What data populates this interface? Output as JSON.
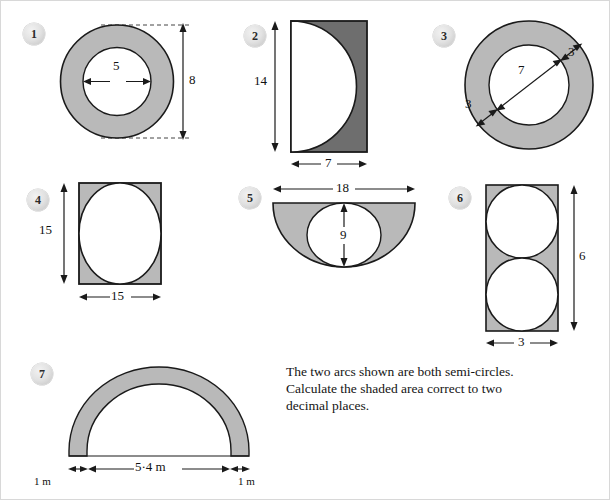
{
  "page": {
    "colors": {
      "shade_light": "#b9b9b9",
      "shade_dark": "#6e6e6e",
      "stroke": "#1a1a1a",
      "white": "#ffffff",
      "badge": "#d8d8d8",
      "text": "#141414"
    }
  },
  "figures": [
    {
      "number": "1",
      "shape": "annulus",
      "description": "Shaded ring between two concentric circles",
      "labels": {
        "inner_diameter": "5",
        "outer_diameter": "8"
      }
    },
    {
      "number": "2",
      "shape": "rectangle-with-semicircle",
      "description": "Rectangle with white semi-circle on the left edge, shaded remainder",
      "labels": {
        "height": "14",
        "width": "7"
      }
    },
    {
      "number": "3",
      "shape": "annulus",
      "description": "Shaded ring with inner diameter and ring width marked",
      "labels": {
        "inner_diameter": "7",
        "ring_width_left": "3",
        "ring_width_right": "3"
      }
    },
    {
      "number": "4",
      "shape": "square-with-inscribed-circle",
      "description": "Square with white inscribed circle, shaded corners",
      "labels": {
        "height": "15",
        "width": "15"
      }
    },
    {
      "number": "5",
      "shape": "semicircle-with-inscribed-circle",
      "description": "Semi-circle with white inscribed circle, shaded remainder",
      "labels": {
        "diameter": "18",
        "circle_diameter": "9"
      }
    },
    {
      "number": "6",
      "shape": "rectangle-with-two-circles",
      "description": "Rectangle containing two white circles, shaded remainder",
      "labels": {
        "height": "6",
        "width": "3"
      }
    },
    {
      "number": "7",
      "shape": "semicircular-arch",
      "description": "Shaded semi-circular arch band",
      "labels": {
        "span": "5·4 m",
        "thickness_left": "1 m",
        "thickness_right": "1 m"
      }
    }
  ],
  "question": {
    "text": "The two arcs shown are both semi-circles.\nCalculate the shaded area correct to two\ndecimal places."
  }
}
